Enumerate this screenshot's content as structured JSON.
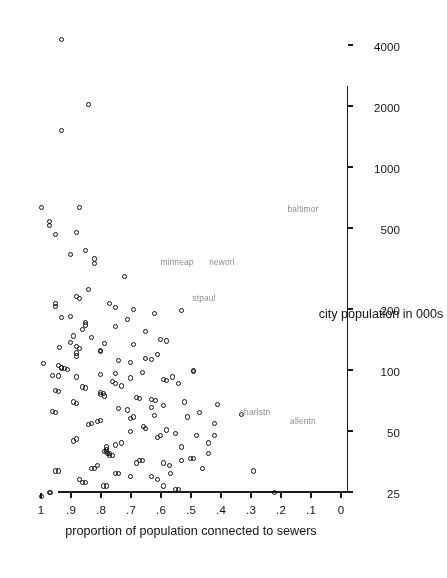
{
  "figure": {
    "background": "#ffffff",
    "ink_color": "#111111",
    "label_color": "#8b8b8b",
    "rotation_degrees": 180,
    "width": 406,
    "height": 578
  },
  "chart_data": {
    "type": "scatter",
    "title": "",
    "xlabel": "city population in 000s",
    "ylabel": "proportion of population connected to sewers",
    "xscale": "log",
    "xlim": [
      22,
      4800
    ],
    "ylim": [
      0,
      1.05
    ],
    "grid": false,
    "legend": null,
    "xticks": [
      25,
      50,
      100,
      200,
      500,
      1000,
      2000,
      4000
    ],
    "xticklabels": [
      "25",
      "50",
      "100",
      "200",
      "500",
      "1000",
      "2000",
      "4000"
    ],
    "yticks": [
      0,
      0.1,
      0.2,
      0.3,
      0.4,
      0.5,
      0.6,
      0.7,
      0.8,
      0.9,
      1
    ],
    "yticklabels": [
      "0",
      ".1",
      ".2",
      ".3",
      ".4",
      ".5",
      ".6",
      ".7",
      ".8",
      ".9",
      "1"
    ],
    "marker": "open-circle",
    "annotations": [
      {
        "text": "minneap",
        "x": 340,
        "y": 0.545
      },
      {
        "text": "stpaul",
        "x": 225,
        "y": 0.455
      },
      {
        "text": "neworl",
        "x": 340,
        "y": 0.395
      },
      {
        "text": "baltimor",
        "x": 620,
        "y": 0.125
      },
      {
        "text": "charlstn",
        "x": 62,
        "y": 0.285
      },
      {
        "text": "allentn",
        "x": 56,
        "y": 0.125
      }
    ],
    "points": [
      {
        "x": 4300,
        "y": 0.935
      },
      {
        "x": 2050,
        "y": 0.845
      },
      {
        "x": 1530,
        "y": 0.935
      },
      {
        "x": 640,
        "y": 1.0
      },
      {
        "x": 640,
        "y": 0.875
      },
      {
        "x": 520,
        "y": 0.975
      },
      {
        "x": 545,
        "y": 0.975
      },
      {
        "x": 470,
        "y": 0.955
      },
      {
        "x": 480,
        "y": 0.885
      },
      {
        "x": 375,
        "y": 0.905
      },
      {
        "x": 390,
        "y": 0.855
      },
      {
        "x": 355,
        "y": 0.825
      },
      {
        "x": 338,
        "y": 0.825
      },
      {
        "x": 292,
        "y": 0.725
      },
      {
        "x": 252,
        "y": 0.845
      },
      {
        "x": 232,
        "y": 0.885
      },
      {
        "x": 226,
        "y": 0.875
      },
      {
        "x": 215,
        "y": 0.955
      },
      {
        "x": 208,
        "y": 0.955
      },
      {
        "x": 215,
        "y": 0.775
      },
      {
        "x": 205,
        "y": 0.755
      },
      {
        "x": 200,
        "y": 0.695
      },
      {
        "x": 197,
        "y": 0.535
      },
      {
        "x": 185,
        "y": 0.905
      },
      {
        "x": 182,
        "y": 0.935
      },
      {
        "x": 172,
        "y": 0.855
      },
      {
        "x": 168,
        "y": 0.855
      },
      {
        "x": 160,
        "y": 0.865
      },
      {
        "x": 148,
        "y": 0.895
      },
      {
        "x": 143,
        "y": 0.605
      },
      {
        "x": 136,
        "y": 0.79
      },
      {
        "x": 135,
        "y": 0.695
      },
      {
        "x": 132,
        "y": 0.885
      },
      {
        "x": 128,
        "y": 0.875
      },
      {
        "x": 126,
        "y": 0.805
      },
      {
        "x": 124,
        "y": 0.805
      },
      {
        "x": 122,
        "y": 0.885
      },
      {
        "x": 118,
        "y": 0.885
      },
      {
        "x": 115,
        "y": 0.655
      },
      {
        "x": 112,
        "y": 0.745
      },
      {
        "x": 110,
        "y": 0.705
      },
      {
        "x": 108,
        "y": 0.995
      },
      {
        "x": 106,
        "y": 0.945
      },
      {
        "x": 104,
        "y": 0.935
      },
      {
        "x": 103,
        "y": 0.935
      },
      {
        "x": 102,
        "y": 0.925
      },
      {
        "x": 101,
        "y": 0.915
      },
      {
        "x": 100,
        "y": 0.495
      },
      {
        "x": 99,
        "y": 0.495
      },
      {
        "x": 98,
        "y": 0.665
      },
      {
        "x": 97,
        "y": 0.755
      },
      {
        "x": 96,
        "y": 0.805
      },
      {
        "x": 95,
        "y": 0.965
      },
      {
        "x": 94,
        "y": 0.945
      },
      {
        "x": 93,
        "y": 0.885
      },
      {
        "x": 92,
        "y": 0.705
      },
      {
        "x": 90,
        "y": 0.595
      },
      {
        "x": 89,
        "y": 0.585
      },
      {
        "x": 88,
        "y": 0.765
      },
      {
        "x": 86,
        "y": 0.755
      },
      {
        "x": 84,
        "y": 0.735
      },
      {
        "x": 83,
        "y": 0.865
      },
      {
        "x": 82,
        "y": 0.855
      },
      {
        "x": 80,
        "y": 0.955
      },
      {
        "x": 79,
        "y": 0.945
      },
      {
        "x": 78,
        "y": 0.805
      },
      {
        "x": 77,
        "y": 0.795
      },
      {
        "x": 76,
        "y": 0.805
      },
      {
        "x": 75,
        "y": 0.79
      },
      {
        "x": 74,
        "y": 0.685
      },
      {
        "x": 73,
        "y": 0.675
      },
      {
        "x": 72,
        "y": 0.635
      },
      {
        "x": 71,
        "y": 0.62
      },
      {
        "x": 70,
        "y": 0.895
      },
      {
        "x": 69,
        "y": 0.885
      },
      {
        "x": 68,
        "y": 0.415
      },
      {
        "x": 67,
        "y": 0.595
      },
      {
        "x": 66,
        "y": 0.635
      },
      {
        "x": 65,
        "y": 0.745
      },
      {
        "x": 64,
        "y": 0.715
      },
      {
        "x": 63,
        "y": 0.965
      },
      {
        "x": 62,
        "y": 0.955
      },
      {
        "x": 61,
        "y": 0.335
      },
      {
        "x": 60,
        "y": 0.625
      },
      {
        "x": 59,
        "y": 0.695
      },
      {
        "x": 58,
        "y": 0.705
      },
      {
        "x": 57,
        "y": 0.805
      },
      {
        "x": 56,
        "y": 0.815
      },
      {
        "x": 55,
        "y": 0.835
      },
      {
        "x": 54,
        "y": 0.845
      },
      {
        "x": 53,
        "y": 0.66
      },
      {
        "x": 52,
        "y": 0.655
      },
      {
        "x": 51,
        "y": 0.585
      },
      {
        "x": 50,
        "y": 0.705
      },
      {
        "x": 49,
        "y": 0.555
      },
      {
        "x": 48,
        "y": 0.605
      },
      {
        "x": 47,
        "y": 0.615
      },
      {
        "x": 46,
        "y": 0.885
      },
      {
        "x": 45,
        "y": 0.895
      },
      {
        "x": 44,
        "y": 0.735
      },
      {
        "x": 43,
        "y": 0.755
      },
      {
        "x": 42,
        "y": 0.785
      },
      {
        "x": 41,
        "y": 0.785
      },
      {
        "x": 40,
        "y": 0.785
      },
      {
        "x": 40,
        "y": 0.79
      },
      {
        "x": 39,
        "y": 0.78
      },
      {
        "x": 39,
        "y": 0.775
      },
      {
        "x": 38,
        "y": 0.775
      },
      {
        "x": 38,
        "y": 0.765
      },
      {
        "x": 37,
        "y": 0.505
      },
      {
        "x": 37,
        "y": 0.495
      },
      {
        "x": 36,
        "y": 0.665
      },
      {
        "x": 36,
        "y": 0.675
      },
      {
        "x": 35,
        "y": 0.685
      },
      {
        "x": 35,
        "y": 0.595
      },
      {
        "x": 34,
        "y": 0.575
      },
      {
        "x": 34,
        "y": 0.815
      },
      {
        "x": 33,
        "y": 0.825
      },
      {
        "x": 33,
        "y": 0.835
      },
      {
        "x": 32,
        "y": 0.945
      },
      {
        "x": 32,
        "y": 0.955
      },
      {
        "x": 31,
        "y": 0.755
      },
      {
        "x": 31,
        "y": 0.745
      },
      {
        "x": 30,
        "y": 0.705
      },
      {
        "x": 30,
        "y": 0.635
      },
      {
        "x": 29,
        "y": 0.615
      },
      {
        "x": 29,
        "y": 0.875
      },
      {
        "x": 28,
        "y": 0.865
      },
      {
        "x": 28,
        "y": 0.855
      },
      {
        "x": 27,
        "y": 0.795
      },
      {
        "x": 27,
        "y": 0.785
      },
      {
        "x": 26,
        "y": 0.545
      },
      {
        "x": 26,
        "y": 0.555
      },
      {
        "x": 25,
        "y": 0.97
      },
      {
        "x": 25,
        "y": 0.975
      },
      {
        "x": 36,
        "y": 0.535
      },
      {
        "x": 42,
        "y": 0.535
      },
      {
        "x": 48,
        "y": 0.485
      },
      {
        "x": 59,
        "y": 0.515
      },
      {
        "x": 70,
        "y": 0.525
      },
      {
        "x": 86,
        "y": 0.545
      },
      {
        "x": 93,
        "y": 0.565
      },
      {
        "x": 48,
        "y": 0.425
      },
      {
        "x": 44,
        "y": 0.445
      },
      {
        "x": 55,
        "y": 0.425
      },
      {
        "x": 62,
        "y": 0.475
      },
      {
        "x": 39,
        "y": 0.445
      },
      {
        "x": 33,
        "y": 0.465
      },
      {
        "x": 31,
        "y": 0.57
      },
      {
        "x": 27,
        "y": 0.595
      },
      {
        "x": 25,
        "y": 0.225
      },
      {
        "x": 32,
        "y": 0.295
      },
      {
        "x": 24,
        "y": 1.0
      },
      {
        "x": 140,
        "y": 0.585
      },
      {
        "x": 120,
        "y": 0.615
      },
      {
        "x": 113,
        "y": 0.635
      },
      {
        "x": 156,
        "y": 0.655
      },
      {
        "x": 165,
        "y": 0.755
      },
      {
        "x": 178,
        "y": 0.715
      },
      {
        "x": 192,
        "y": 0.625
      },
      {
        "x": 146,
        "y": 0.835
      },
      {
        "x": 138,
        "y": 0.905
      },
      {
        "x": 130,
        "y": 0.94
      }
    ]
  },
  "axis_titles": {
    "x": "city population in 000s",
    "y": "proportion of population connected to sewers"
  }
}
